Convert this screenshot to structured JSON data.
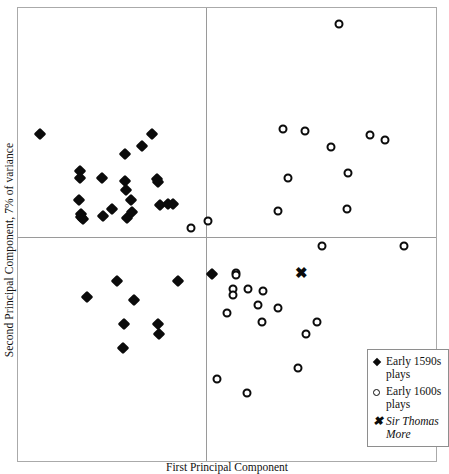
{
  "chart_data": {
    "type": "scatter",
    "title": "",
    "xlabel": "First Principal Component",
    "ylabel": "Second Principal Component, 7% of variance",
    "grid": false,
    "axes": {
      "origin_x_px": 205,
      "origin_y_px": 236,
      "note": "Axes drawn as crossed lines through origin; no numeric tick labels shown."
    },
    "legend": {
      "position": "bottom-right",
      "entries": [
        {
          "key": "diamond",
          "label": "Early 1590s plays",
          "italic": false
        },
        {
          "key": "circle",
          "label": "Early 1600s plays",
          "italic": false
        },
        {
          "key": "cross",
          "label": "Sir Thomas More",
          "italic": true
        }
      ]
    },
    "series": [
      {
        "name": "Early 1590s plays",
        "marker": "diamond",
        "color": "#0b0b0b",
        "points": [
          [
            39,
            133
          ],
          [
            79,
            170
          ],
          [
            79,
            177
          ],
          [
            80,
            213
          ],
          [
            80,
            216
          ],
          [
            82,
            218
          ],
          [
            78,
            199
          ],
          [
            101,
            177
          ],
          [
            102,
            215
          ],
          [
            111,
            208
          ],
          [
            124,
            153
          ],
          [
            124,
            180
          ],
          [
            125,
            189
          ],
          [
            126,
            217
          ],
          [
            130,
            199
          ],
          [
            131,
            211
          ],
          [
            151,
            133
          ],
          [
            141,
            145
          ],
          [
            157,
            181
          ],
          [
            156,
            178
          ],
          [
            159,
            204
          ],
          [
            167,
            203
          ],
          [
            172,
            203
          ],
          [
            116,
            280
          ],
          [
            177,
            280
          ],
          [
            86,
            296
          ],
          [
            133,
            299
          ],
          [
            123,
            323
          ],
          [
            157,
            323
          ],
          [
            158,
            333
          ],
          [
            122,
            347
          ],
          [
            211,
            273
          ]
        ]
      },
      {
        "name": "Early 1600s plays",
        "marker": "circle",
        "color": "#0b0b0b",
        "points": [
          [
            338,
            23
          ],
          [
            282,
            128
          ],
          [
            304,
            130
          ],
          [
            330,
            146
          ],
          [
            369,
            134
          ],
          [
            384,
            139
          ],
          [
            287,
            177
          ],
          [
            347,
            172
          ],
          [
            277,
            210
          ],
          [
            346,
            208
          ],
          [
            190,
            227
          ],
          [
            207,
            220
          ],
          [
            321,
            245
          ],
          [
            403,
            245
          ],
          [
            235,
            272
          ],
          [
            235,
            274
          ],
          [
            232,
            288
          ],
          [
            232,
            294
          ],
          [
            247,
            288
          ],
          [
            262,
            290
          ],
          [
            226,
            312
          ],
          [
            257,
            304
          ],
          [
            277,
            307
          ],
          [
            305,
            333
          ],
          [
            261,
            321
          ],
          [
            316,
            321
          ],
          [
            297,
            367
          ],
          [
            216,
            378
          ],
          [
            246,
            392
          ]
        ]
      },
      {
        "name": "Sir Thomas More",
        "marker": "cross",
        "color": "#0b0b0b",
        "points": [
          [
            300,
            272
          ]
        ]
      }
    ]
  },
  "axis": {
    "ylabel": "Second Principal Component, 7% of variance",
    "xlabel": "First Principal Component"
  },
  "legend": {
    "entry_1_label": "Early 1590s plays",
    "entry_2_label": "Early 1600s plays",
    "entry_3_label": "Sir Thomas More",
    "key_1_icon": "diamond-marker-icon",
    "key_2_icon": "circle-marker-icon",
    "key_3_icon": "cross-marker-icon"
  }
}
